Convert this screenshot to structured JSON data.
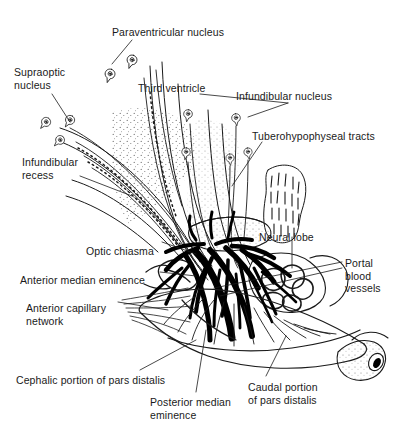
{
  "figure": {
    "background_color": "#ffffff",
    "ink_color": "#1a1a1a",
    "width": 403,
    "height": 431
  },
  "labels": [
    {
      "id": "paraventricular-nucleus",
      "text": "Paraventricular nucleus",
      "x": 112,
      "y": 26
    },
    {
      "id": "supraoptic-nucleus",
      "line1": "Supraoptic",
      "line2": "nucleus",
      "x": 14,
      "y": 66
    },
    {
      "id": "third-ventricle",
      "text": "Third ventricle",
      "x": 138,
      "y": 82
    },
    {
      "id": "infundibular-nucleus",
      "text": "Infundibular nucleus",
      "x": 236,
      "y": 90
    },
    {
      "id": "tuberohypophyseal-tracts",
      "text": "Tuberohypophyseal tracts",
      "x": 252,
      "y": 130
    },
    {
      "id": "infundibular-recess",
      "line1": "Infundibular",
      "line2": "recess",
      "x": 22,
      "y": 156
    },
    {
      "id": "optic-chiasma",
      "text": "Optic chiasma",
      "x": 86,
      "y": 245
    },
    {
      "id": "neural-lobe",
      "text": "Neural lobe",
      "x": 259,
      "y": 231
    },
    {
      "id": "anterior-median-eminence",
      "text": "Anterior median eminence",
      "x": 20,
      "y": 274
    },
    {
      "id": "portal-blood-vessels",
      "line1": "Portal",
      "line2": "blood",
      "line3": "vessels",
      "x": 345,
      "y": 257
    },
    {
      "id": "anterior-capillary-network",
      "line1": "Anterior capillary",
      "line2": "network",
      "x": 26,
      "y": 302
    },
    {
      "id": "cephalic-portion-of-pars-distalis",
      "text": "Cephalic portion of pars distalis",
      "x": 16,
      "y": 374
    },
    {
      "id": "posterior-median-eminence",
      "line1": "Posterior median",
      "line2": "eminence",
      "x": 150,
      "y": 396
    },
    {
      "id": "caudal-portion-of-pars-distalis",
      "line1": "Caudal portion",
      "line2": "of pars distalis",
      "x": 248,
      "y": 381
    }
  ],
  "leaders": [
    {
      "id": "leader-paraventricular-nucleus",
      "d": "M132,40 L112,64"
    },
    {
      "id": "leader-supraoptic-nucleus",
      "d": "M52,94 L70,122"
    },
    {
      "id": "leader-infundibular-nucleus",
      "d": "M288,103 L248,117"
    },
    {
      "id": "leader-infundibular-nucleus-b",
      "d": "M288,103 L200,94"
    },
    {
      "id": "leader-tuberohypophyseal-tracts",
      "d": "M262,142 L232,186"
    },
    {
      "id": "leader-infundibular-recess",
      "d": "M80,176 L132,196"
    },
    {
      "id": "leader-optic-chiasma",
      "d": "M162,242 L196,254"
    },
    {
      "id": "leader-neural-lobe",
      "d": "M292,237 L292,268"
    },
    {
      "id": "leader-anterior-median-eminence",
      "d": "M160,272 L196,276"
    },
    {
      "id": "leader-portal-1",
      "d": "M342,262 L214,288"
    },
    {
      "id": "leader-portal-2",
      "d": "M342,268 L220,296"
    },
    {
      "id": "leader-anterior-capillary-network",
      "d": "M118,302 L168,310"
    },
    {
      "id": "leader-cephalic-pars-distalis",
      "d": "M140,370 L196,340"
    },
    {
      "id": "leader-posterior-median-eminence",
      "d": "M196,392 L206,330"
    },
    {
      "id": "leader-caudal-pars-distalis",
      "d": "M266,376 L286,336"
    }
  ]
}
